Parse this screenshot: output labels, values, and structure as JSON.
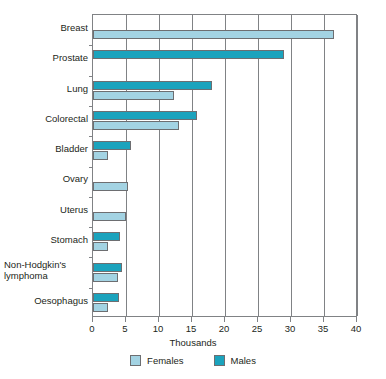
{
  "chart_data": {
    "type": "bar",
    "orientation": "horizontal",
    "title": "",
    "xlabel": "Thousands",
    "ylabel": "",
    "xlim": [
      0,
      40
    ],
    "xticks": [
      0,
      5,
      10,
      15,
      20,
      25,
      30,
      35,
      40
    ],
    "xtick_labels": [
      "0",
      "5",
      "10",
      "15",
      "20",
      "25",
      "30",
      "35",
      "40"
    ],
    "grid": true,
    "grid_axis": "x",
    "legend_position": "bottom",
    "categories": [
      "Breast",
      "Prostate",
      "Lung",
      "Colorectal",
      "Bladder",
      "Ovary",
      "Uterus",
      "Stomach",
      "Non-Hodgkin's\nlymphoma",
      "Oesophagus"
    ],
    "series": [
      {
        "name": "Males",
        "color": "#1ba3bd",
        "values": [
          null,
          29.0,
          18.0,
          15.7,
          5.7,
          null,
          null,
          4.1,
          4.4,
          4.0
        ]
      },
      {
        "name": "Females",
        "color": "#a3d3e3",
        "values": [
          36.5,
          null,
          12.2,
          13.0,
          2.2,
          5.3,
          5.0,
          2.2,
          3.8,
          2.2
        ]
      }
    ]
  },
  "legend": {
    "items": [
      {
        "label": "Females",
        "color": "#a3d3e3",
        "swatch": "females"
      },
      {
        "label": "Males",
        "color": "#1ba3bd",
        "swatch": "males"
      }
    ]
  },
  "colors": {
    "males": "#1ba3bd",
    "females": "#a3d3e3",
    "axis": "#808285",
    "text": "#231f20",
    "background": "#ffffff"
  }
}
